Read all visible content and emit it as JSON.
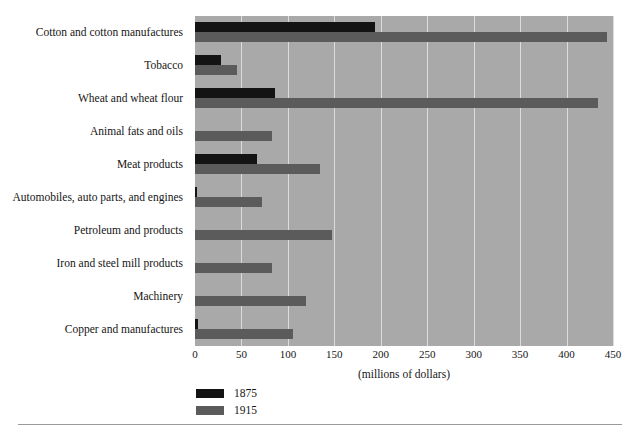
{
  "chart_data": {
    "type": "bar",
    "orientation": "horizontal",
    "title": "",
    "subtitle": "",
    "xlabel": "(millions of dollars)",
    "ylabel": "",
    "xlim": [
      0,
      450
    ],
    "xticks": [
      0,
      50,
      100,
      150,
      200,
      250,
      300,
      350,
      400,
      450
    ],
    "xticklabels": [
      "0",
      "50",
      "100",
      "150",
      "200",
      "250",
      "300",
      "350",
      "400",
      "450"
    ],
    "grid": "vertical",
    "legend_position": "below-left",
    "categories": [
      "Cotton and cotton manufactures",
      "Tobacco",
      "Wheat and wheat flour",
      "Animal fats and oils",
      "Meat products",
      "Automobiles, auto parts, and engines",
      "Petroleum and products",
      "Iron and steel mill products",
      "Machinery",
      "Copper and manufactures"
    ],
    "series": [
      {
        "name": "1875",
        "color": "#131313",
        "values": [
          194,
          28,
          86,
          0,
          67,
          2,
          0,
          0,
          0,
          3
        ]
      },
      {
        "name": "1915",
        "color": "#5b5b5b",
        "values": [
          444,
          45,
          434,
          83,
          135,
          72,
          147,
          83,
          119,
          105
        ]
      }
    ]
  },
  "axis": {
    "x_label": "(millions of dollars)",
    "tick_labels": [
      "0",
      "50",
      "100",
      "150",
      "200",
      "250",
      "300",
      "350",
      "400",
      "450"
    ]
  },
  "legend": {
    "entries": [
      {
        "label": "1875",
        "color": "#131313"
      },
      {
        "label": "1915",
        "color": "#5b5b5b"
      }
    ]
  },
  "colors": {
    "plot_background": "#a9a9a9",
    "gridline": "#dcdcdc",
    "series_1875": "#131313",
    "series_1915": "#5b5b5b",
    "page_background": "#ffffff",
    "text": "#151515",
    "rule": "#9a9a9a"
  }
}
